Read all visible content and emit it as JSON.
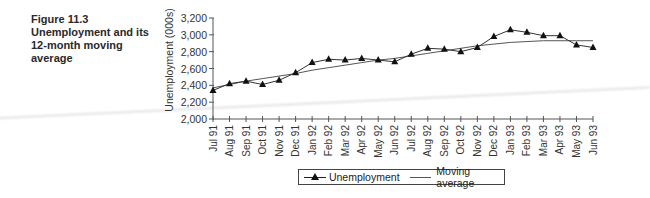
{
  "figure": {
    "number": "Figure 11.3",
    "title": "Unemployment and its 12-month moving average"
  },
  "legend": {
    "series1": "Unemployment",
    "series2": "Moving average"
  },
  "colors": {
    "line": "#333333",
    "marker": "#111111",
    "axis": "#555555"
  },
  "chart_data": {
    "type": "line",
    "title": "Unemployment and its 12-month moving average",
    "xlabel": "",
    "ylabel": "Unemployment (000s)",
    "ylim": [
      2000,
      3200
    ],
    "yticks": [
      "2,000",
      "2,200",
      "2,400",
      "2,600",
      "2,800",
      "3,000",
      "3,200"
    ],
    "grid": false,
    "legend_position": "bottom",
    "categories": [
      "Jul 91",
      "Aug 91",
      "Sep 91",
      "Oct 91",
      "Nov 91",
      "Dec 91",
      "Jan 92",
      "Feb 92",
      "Mar 92",
      "Apr 92",
      "May 92",
      "Jun 92",
      "Jul 92",
      "Aug 92",
      "Sep 92",
      "Oct 92",
      "Nov 92",
      "Dec 92",
      "Jan 93",
      "Feb 93",
      "Mar 93",
      "Apr 93",
      "May 93",
      "Jun 93"
    ],
    "series": [
      {
        "name": "Unemployment",
        "marker": "triangle",
        "values": [
          2340,
          2420,
          2450,
          2410,
          2460,
          2550,
          2670,
          2710,
          2700,
          2720,
          2700,
          2680,
          2770,
          2840,
          2830,
          2800,
          2850,
          2980,
          3060,
          3030,
          2990,
          2990,
          2880,
          2850
        ]
      },
      {
        "name": "Moving average",
        "marker": "none",
        "values": [
          2370,
          2410,
          2450,
          2480,
          2510,
          2540,
          2580,
          2610,
          2640,
          2670,
          2700,
          2720,
          2750,
          2780,
          2810,
          2840,
          2870,
          2890,
          2910,
          2920,
          2930,
          2930,
          2930,
          2930
        ]
      }
    ]
  }
}
